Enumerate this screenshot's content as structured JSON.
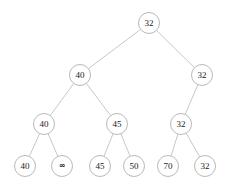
{
  "figure": {
    "name": "binary-tree-diagram",
    "background_color": "#ffffff",
    "node_stroke_color": "#b9b9b9",
    "node_fill_color": "#ffffff",
    "edge_color": "#b9b9b9",
    "text_color": "#1a1a1a",
    "node_radius": 11,
    "node_stroke_width": 0.9,
    "edge_stroke_width": 0.8,
    "label_font_size": 9
  },
  "tree": {
    "levels": 4,
    "node_count": 13,
    "nodes": [
      {
        "id": "n0",
        "label": "32",
        "level": 0,
        "cx": 149,
        "cy": 23,
        "r": 11,
        "parent": null
      },
      {
        "id": "n1",
        "label": "40",
        "level": 1,
        "cx": 80,
        "cy": 75,
        "r": 11,
        "parent": "n0"
      },
      {
        "id": "n2",
        "label": "32",
        "level": 1,
        "cx": 202,
        "cy": 75,
        "r": 11,
        "parent": "n0"
      },
      {
        "id": "n3",
        "label": "40",
        "level": 2,
        "cx": 44,
        "cy": 124,
        "r": 11,
        "parent": "n1"
      },
      {
        "id": "n4",
        "label": "45",
        "level": 2,
        "cx": 117,
        "cy": 124,
        "r": 11,
        "parent": "n1"
      },
      {
        "id": "n5",
        "label": "32",
        "level": 2,
        "cx": 181,
        "cy": 124,
        "r": 11,
        "parent": "n2"
      },
      {
        "id": "n6",
        "label": "40",
        "level": 3,
        "cx": 25,
        "cy": 166,
        "r": 11,
        "parent": "n3"
      },
      {
        "id": "n7",
        "label": "∞",
        "level": 3,
        "cx": 62,
        "cy": 166,
        "r": 11,
        "parent": "n3"
      },
      {
        "id": "n8",
        "label": "45",
        "level": 3,
        "cx": 100,
        "cy": 166,
        "r": 11,
        "parent": "n4"
      },
      {
        "id": "n9",
        "label": "50",
        "level": 3,
        "cx": 134,
        "cy": 166,
        "r": 11,
        "parent": "n4"
      },
      {
        "id": "n10",
        "label": "70",
        "level": 3,
        "cx": 168,
        "cy": 166,
        "r": 11,
        "parent": "n5"
      },
      {
        "id": "n11",
        "label": "32",
        "level": 3,
        "cx": 205,
        "cy": 166,
        "r": 11,
        "parent": "n5"
      }
    ],
    "edges": [
      {
        "from": "n0",
        "to": "n1",
        "x1": 149,
        "y1": 23,
        "x2": 80,
        "y2": 75
      },
      {
        "from": "n0",
        "to": "n2",
        "x1": 149,
        "y1": 23,
        "x2": 202,
        "y2": 75
      },
      {
        "from": "n1",
        "to": "n3",
        "x1": 80,
        "y1": 75,
        "x2": 44,
        "y2": 124
      },
      {
        "from": "n1",
        "to": "n4",
        "x1": 80,
        "y1": 75,
        "x2": 117,
        "y2": 124
      },
      {
        "from": "n2",
        "to": "n5",
        "x1": 202,
        "y1": 75,
        "x2": 181,
        "y2": 124
      },
      {
        "from": "n3",
        "to": "n6",
        "x1": 44,
        "y1": 124,
        "x2": 25,
        "y2": 166
      },
      {
        "from": "n3",
        "to": "n7",
        "x1": 44,
        "y1": 124,
        "x2": 62,
        "y2": 166
      },
      {
        "from": "n4",
        "to": "n8",
        "x1": 117,
        "y1": 124,
        "x2": 100,
        "y2": 166
      },
      {
        "from": "n4",
        "to": "n9",
        "x1": 117,
        "y1": 124,
        "x2": 134,
        "y2": 166
      },
      {
        "from": "n5",
        "to": "n10",
        "x1": 181,
        "y1": 124,
        "x2": 168,
        "y2": 166
      },
      {
        "from": "n5",
        "to": "n11",
        "x1": 181,
        "y1": 124,
        "x2": 205,
        "y2": 166
      }
    ]
  }
}
